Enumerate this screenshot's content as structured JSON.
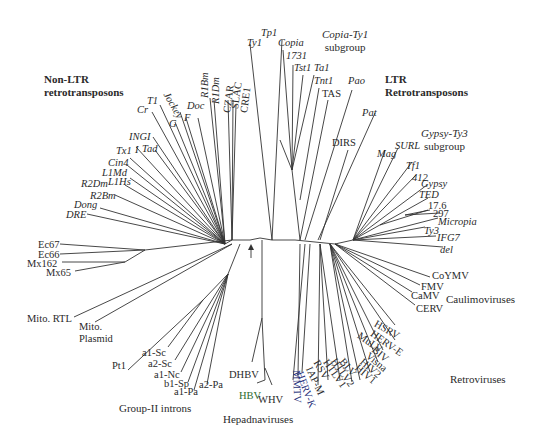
{
  "groups": {
    "non_ltr": {
      "line1": "Non-LTR",
      "line2": "retrotransposons"
    },
    "ltr": {
      "line1": "LTR",
      "line2": "Retrotransposons"
    },
    "copia": {
      "line1": "Copia-Ty1",
      "line2": "subgroup"
    },
    "gypsy": {
      "line1": "Gypsy-Ty3",
      "line2": "subgroup"
    },
    "caulimo": "Caulimoviruses",
    "retro": "Retroviruses",
    "hepadna": "Hepadnaviruses",
    "group2": "Group-II introns"
  },
  "labels": {
    "Ty1": "Ty1",
    "Tp1": "Tp1",
    "Copia": "Copia",
    "l1731": "1731",
    "Tst1": "Tst1",
    "Ta1": "Ta1",
    "Tnt1": "Tnt1",
    "TAS": "TAS",
    "Pao": "Pao",
    "Pat": "Pat",
    "DIRS": "DIRS",
    "Mag": "Mag",
    "SURL": "SURL",
    "Tf1": "Tf1",
    "l412": "412",
    "Gypsy": "Gypsy",
    "TED": "TED",
    "l176": "17.6",
    "l297": "297",
    "Micropia": "Micropia",
    "Ty3": "Ty3",
    "IFG7": "IFG7",
    "del": "del",
    "CoYMV": "CoYMV",
    "FMV": "FMV",
    "CaMV": "CaMV",
    "CERV": "CERV",
    "HSRV": "HSRV",
    "HERVE": "HERV-E",
    "MuLV": "MuLV",
    "BIV": "BIV",
    "Visna": "Visna",
    "HIV2": "HIV2",
    "HIV1": "HIV1",
    "BLV": "BLV",
    "HTLV2": "HTLV2",
    "HTLV1": "HTLV1",
    "RSV": "RSV",
    "IAPM": "IAP-M",
    "HERVK": "HERV-K",
    "MMTV": "MMTV",
    "DHBV": "DHBV",
    "HBV": "HBV",
    "WHV": "WHV",
    "a1Sc": "a1-Sc",
    "a2Sc": "a2-Sc",
    "a1Nc": "a1-Nc",
    "b1Sp": "b1-Sp",
    "a1Pa": "a1-Pa",
    "a2Pa": "a2-Pa",
    "Pt1": "Pt1",
    "MitoRTL": "Mito. RTL",
    "MitoPl1": "Mito.",
    "MitoPl2": "Plasmid",
    "Ec67": "Ec67",
    "Ec66": "Ec66",
    "Mx162": "Mx162",
    "Mx65": "Mx65",
    "DRE": "DRE",
    "Dong": "Dong",
    "R2Bm": "R2Bm",
    "R2Dm": "R2Dm",
    "L1Hs": "L1Hs",
    "L1Md": "L1Md",
    "Cin4": "Cin4",
    "Tx1": "Tx1",
    "I": "I",
    "Tad": "Tad",
    "INGI": "INGI",
    "Cr": "Cr",
    "T1": "T1",
    "Jockey": "Jockey",
    "G": "G",
    "F": "F",
    "Doc": "Doc",
    "R1Bm": "R1Bm",
    "R1Dm": "R1Dm",
    "CZAR": "CZAR",
    "SLAC": "SLAC",
    "CRE1": "CRE1"
  },
  "colors": {
    "HBV": "#2e6b2e",
    "HERVK": "#1f2f7a",
    "MMTV": "#1f2f7a",
    "default": "#2a2a2a"
  }
}
